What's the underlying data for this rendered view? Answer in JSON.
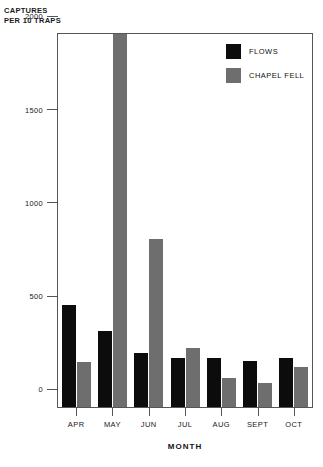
{
  "chart_data": {
    "type": "bar",
    "title": "",
    "xlabel": "MONTH",
    "ylabel": "CAPTURES\nPER 10 TRAPS",
    "categories": [
      "APR",
      "MAY",
      "JUN",
      "JUL",
      "AUG",
      "SEPT",
      "OCT"
    ],
    "series": [
      {
        "name": "FLOWS",
        "color": "#0c0c0c",
        "values": [
          545,
          405,
          290,
          265,
          265,
          245,
          265
        ]
      },
      {
        "name": "CHAPEL FELL",
        "color": "#6e6e6e",
        "values": [
          240,
          2000,
          900,
          315,
          155,
          130,
          215
        ]
      }
    ],
    "ylim": [
      0,
      2000
    ],
    "yticks": [
      0,
      500,
      1000,
      1500,
      2000
    ],
    "ytick_labels": [
      "0",
      "500",
      "1000",
      "1500",
      "2000"
    ],
    "grid": false,
    "legend_position": "top-right"
  }
}
